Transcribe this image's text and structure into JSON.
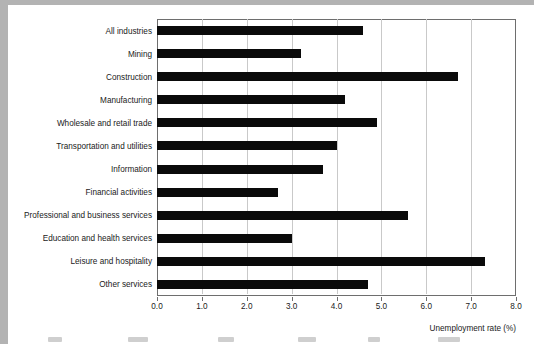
{
  "chart_data": {
    "type": "bar",
    "orientation": "horizontal",
    "title": "",
    "subtitle": "",
    "xlabel": "Unemployment rate (%)",
    "ylabel": "",
    "xlim": [
      0.0,
      8.0
    ],
    "xticks": [
      "0.0",
      "1.0",
      "2.0",
      "3.0",
      "4.0",
      "5.0",
      "6.0",
      "7.0",
      "8.0"
    ],
    "xtick_values": [
      0.0,
      1.0,
      2.0,
      3.0,
      4.0,
      5.0,
      6.0,
      7.0,
      8.0
    ],
    "grid": "vertical",
    "legend": "none",
    "bar_color": "#0a0a0a",
    "categories": [
      "All industries",
      "Mining",
      "Construction",
      "Manufacturing",
      "Wholesale and retail trade",
      "Transportation and utilities",
      "Information",
      "Financial activities",
      "Professional and business services",
      "Education and health services",
      "Leisure and hospitality",
      "Other services"
    ],
    "values": [
      4.6,
      3.2,
      6.7,
      4.2,
      4.9,
      4.0,
      3.7,
      2.7,
      5.6,
      3.0,
      7.3,
      4.7
    ]
  },
  "page": {
    "background": "#b3b3b3",
    "sheet_color": "#ffffff"
  }
}
